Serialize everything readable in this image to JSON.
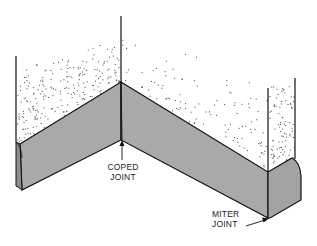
{
  "diagram": {
    "labels": {
      "coped": [
        "COPED",
        "JOINT"
      ],
      "miter": [
        "MITER",
        "JOINT"
      ]
    },
    "colors": {
      "baseboard_fill": "#a9a9a9",
      "baseboard_end": "#9a9a9a",
      "wall_texture": "#333333",
      "line": "#111111",
      "background": "#ffffff"
    }
  }
}
